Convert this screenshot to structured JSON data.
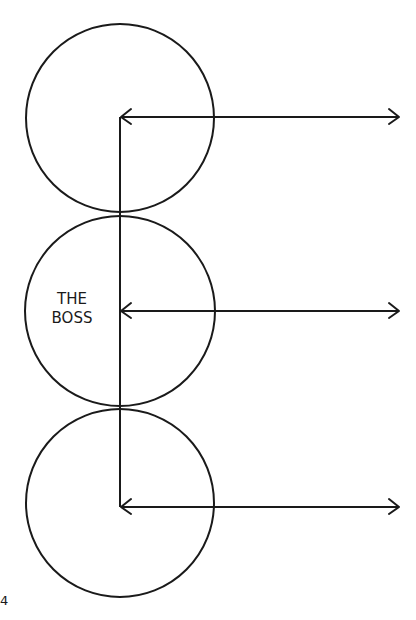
{
  "diagram": {
    "circles": [
      {
        "id": "top",
        "label": ""
      },
      {
        "id": "middle",
        "label_line1": "THE",
        "label_line2": "BOSS"
      },
      {
        "id": "bottom",
        "label": ""
      }
    ],
    "arrows": [
      {
        "from": "vertical-line",
        "direction": "bidirectional",
        "row": "top"
      },
      {
        "from": "vertical-line",
        "direction": "bidirectional",
        "row": "middle"
      },
      {
        "from": "vertical-line",
        "direction": "bidirectional",
        "row": "bottom"
      }
    ],
    "stroke_color": "#1a1a1a",
    "background": "#ffffff"
  },
  "page_number": "4"
}
